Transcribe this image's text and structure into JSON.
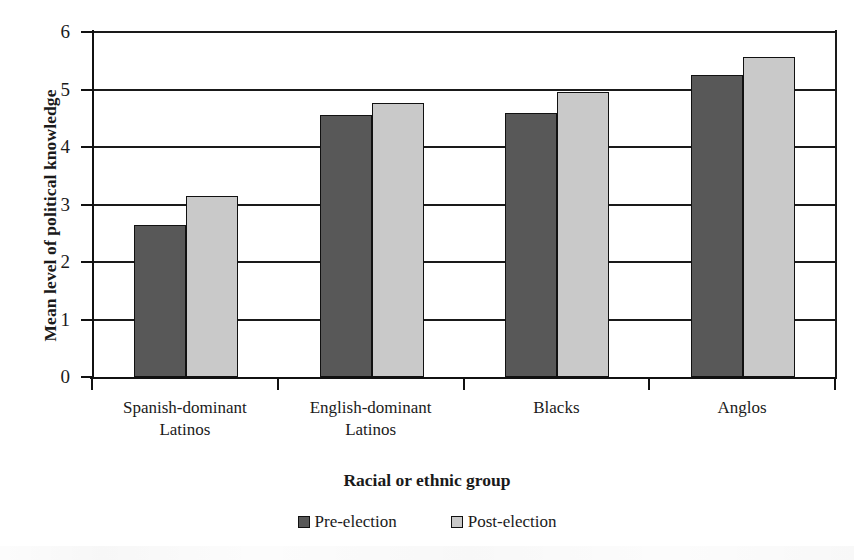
{
  "chart_data": {
    "type": "bar",
    "title": "",
    "xlabel": "Racial or ethnic group",
    "ylabel": "Mean level of political knowledge",
    "categories": [
      "Spanish-dominant Latinos",
      "English-dominant Latinos",
      "Blacks",
      "Anglos"
    ],
    "category_lines": [
      [
        "Spanish-dominant",
        "Latinos"
      ],
      [
        "English-dominant",
        "Latinos"
      ],
      [
        "Blacks",
        ""
      ],
      [
        "Anglos",
        ""
      ]
    ],
    "series": [
      {
        "name": "Pre-election",
        "color": "#585858",
        "values": [
          2.65,
          4.56,
          4.6,
          5.25
        ]
      },
      {
        "name": "Post-election",
        "color": "#c9c9c9",
        "values": [
          3.15,
          4.77,
          4.95,
          5.57
        ]
      }
    ],
    "ylim": [
      0,
      6
    ],
    "yticks": [
      0,
      1,
      2,
      3,
      4,
      5,
      6
    ],
    "ytick_labels": [
      "0",
      "1",
      "2",
      "3",
      "4",
      "5",
      "6"
    ],
    "grid": true,
    "grid_axis": "y",
    "legend_position": "bottom"
  },
  "legend": {
    "items": [
      {
        "label": "Pre-election",
        "swatch": "pre"
      },
      {
        "label": "Post-election",
        "swatch": "post"
      }
    ]
  }
}
